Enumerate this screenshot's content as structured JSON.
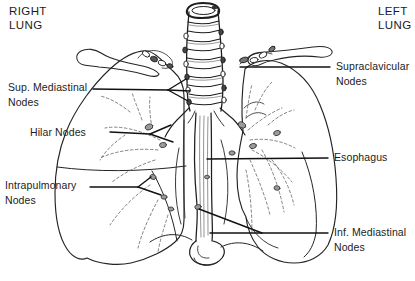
{
  "figure": {
    "type": "anatomical-line-drawing"
  },
  "corner_labels": {
    "right_lung": {
      "line1": "RIGHT",
      "line2": "LUNG"
    },
    "left_lung": {
      "line1": "LEFT",
      "line2": "LUNG"
    }
  },
  "annotations": {
    "sup_mediastinal": {
      "line1": "Sup. Mediastinal",
      "line2": "Nodes"
    },
    "hilar": {
      "line1": "Hilar Nodes"
    },
    "intrapulmonary": {
      "line1": "Intrapulmonary",
      "line2": "Nodes"
    },
    "supraclavicular": {
      "line1": "Supraclavicular",
      "line2": "Nodes"
    },
    "esophagus": {
      "line1": "Esophagus"
    },
    "inf_mediastinal": {
      "line1": "Inf. Mediastinal",
      "line2": "Nodes"
    }
  },
  "colors": {
    "ink": "#222222",
    "leader_line": "#111111",
    "node_fill": "#9a9a9a",
    "background": "#ffffff"
  }
}
